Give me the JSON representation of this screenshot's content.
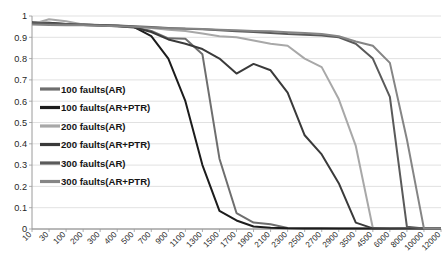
{
  "chart_data": {
    "type": "line",
    "title": "",
    "xlabel": "",
    "ylabel": "",
    "ylim": [
      0,
      1
    ],
    "grid": true,
    "legend_position": "inside-left",
    "yticks": [
      "0",
      "0.1",
      "0.2",
      "0.3",
      "0.4",
      "0.5",
      "0.6",
      "0.7",
      "0.8",
      "0.9",
      "1"
    ],
    "ytick_values": [
      0,
      0.1,
      0.2,
      0.3,
      0.4,
      0.5,
      0.6,
      0.7,
      0.8,
      0.9,
      1
    ],
    "categories": [
      "10",
      "30",
      "100",
      "200",
      "300",
      "400",
      "500",
      "700",
      "900",
      "1100",
      "1300",
      "1500",
      "1700",
      "1900",
      "2100",
      "2300",
      "2500",
      "2700",
      "2900",
      "3500",
      "4500",
      "6000",
      "8000",
      "10000",
      "12000"
    ],
    "series": [
      {
        "name": "100 faults(AR)",
        "color": "#6e6e6e",
        "width": 2.0,
        "values": [
          0.965,
          0.962,
          0.96,
          0.958,
          0.956,
          0.953,
          0.948,
          0.93,
          0.895,
          0.893,
          0.82,
          0.33,
          0.075,
          0.03,
          0.022,
          0.005,
          0.004,
          0.003,
          0.002,
          0.002,
          0.002,
          0.002,
          0.002,
          0.002,
          0.002
        ]
      },
      {
        "name": "100 faults(AR+PTR)",
        "color": "#1c1c1c",
        "width": 2.0,
        "values": [
          0.97,
          0.968,
          0.963,
          0.96,
          0.957,
          0.954,
          0.948,
          0.905,
          0.8,
          0.6,
          0.3,
          0.085,
          0.04,
          0.012,
          0.006,
          0.003,
          0.002,
          0.002,
          0.002,
          0.002,
          0.002,
          0.002,
          0.002,
          0.002,
          0.002
        ]
      },
      {
        "name": "200 faults(AR)",
        "color": "#a8a8a8",
        "width": 2.0,
        "values": [
          0.962,
          0.985,
          0.975,
          0.96,
          0.957,
          0.955,
          0.95,
          0.944,
          0.935,
          0.93,
          0.918,
          0.905,
          0.9,
          0.885,
          0.87,
          0.86,
          0.8,
          0.76,
          0.61,
          0.39,
          0.005,
          0.003,
          0.002,
          0.002,
          0.002
        ]
      },
      {
        "name": "200 faults(AR+PTR)",
        "color": "#3a3a3a",
        "width": 2.0,
        "values": [
          0.968,
          0.965,
          0.96,
          0.958,
          0.955,
          0.952,
          0.946,
          0.925,
          0.89,
          0.87,
          0.845,
          0.8,
          0.73,
          0.775,
          0.745,
          0.64,
          0.44,
          0.35,
          0.215,
          0.03,
          0.003,
          0.002,
          0.002,
          0.002,
          0.002
        ]
      },
      {
        "name": "300 faults(AR)",
        "color": "#5a5a5a",
        "width": 2.0,
        "values": [
          0.968,
          0.966,
          0.963,
          0.96,
          0.958,
          0.955,
          0.952,
          0.948,
          0.944,
          0.94,
          0.938,
          0.933,
          0.928,
          0.925,
          0.92,
          0.915,
          0.912,
          0.908,
          0.9,
          0.87,
          0.8,
          0.62,
          0.01,
          0.002,
          0.002
        ]
      },
      {
        "name": "300 faults(AR+PTR)",
        "color": "#858585",
        "width": 2.0,
        "values": [
          0.96,
          0.958,
          0.957,
          0.956,
          0.954,
          0.952,
          0.95,
          0.946,
          0.943,
          0.941,
          0.939,
          0.936,
          0.933,
          0.93,
          0.928,
          0.924,
          0.92,
          0.915,
          0.905,
          0.88,
          0.86,
          0.78,
          0.42,
          0.002,
          0.002
        ]
      }
    ],
    "legend": [
      {
        "label": "100 faults(AR)",
        "color": "#6e6e6e"
      },
      {
        "label": "100 faults(AR+PTR)",
        "color": "#1c1c1c"
      },
      {
        "label": "200 faults(AR)",
        "color": "#a8a8a8"
      },
      {
        "label": "200 faults(AR+PTR)",
        "color": "#3a3a3a"
      },
      {
        "label": "300 faults(AR)",
        "color": "#5a5a5a"
      },
      {
        "label": "300 faults(AR+PTR)",
        "color": "#858585"
      }
    ],
    "colors": {
      "grid": "#d9d9d9",
      "axis": "#9a9a9a",
      "background": "#ffffff",
      "tick_label": "#2b2b2b"
    }
  }
}
